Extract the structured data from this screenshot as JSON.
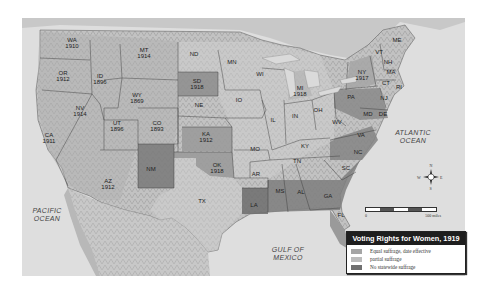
{
  "map": {
    "title": "Voting Rights for Women, 1919",
    "type": "choropleth",
    "region": "Continental United States",
    "colors": {
      "equal": "#a8a8a8",
      "partial": "#cfcfcf",
      "none": "#7a7a7a",
      "ocean": "#dedede",
      "land_terrain": "#bdbdbd"
    },
    "legend": [
      {
        "key": "equal",
        "label": "Equal suffrage, date effective",
        "color": "#a5a5a5"
      },
      {
        "key": "partial",
        "label": "partial suffrage",
        "color": "#bcbcbc"
      },
      {
        "key": "none",
        "label": "No statewide suffrage",
        "color": "#707070"
      }
    ],
    "scale": {
      "start": "0",
      "end": "500 miles"
    },
    "compass": {
      "n": "N",
      "s": "S",
      "e": "E",
      "w": "W"
    },
    "oceans": [
      {
        "name": "PACIFIC\nOCEAN",
        "x": 47,
        "y": 215
      },
      {
        "name": "ATLANTIC\nOCEAN",
        "x": 413,
        "y": 137
      },
      {
        "name": "GULF OF\nMEXICO",
        "x": 288,
        "y": 254
      }
    ],
    "states": [
      {
        "abbr": "WA",
        "year": "1910",
        "x": 72,
        "y": 43,
        "status": "equal"
      },
      {
        "abbr": "OR",
        "year": "1912",
        "x": 63,
        "y": 76,
        "status": "equal"
      },
      {
        "abbr": "CA",
        "year": "1911",
        "x": 49,
        "y": 138,
        "status": "equal"
      },
      {
        "abbr": "ID",
        "year": "1896",
        "x": 100,
        "y": 79,
        "status": "equal"
      },
      {
        "abbr": "NV",
        "year": "1914",
        "x": 80,
        "y": 111,
        "status": "equal"
      },
      {
        "abbr": "MT",
        "year": "1914",
        "x": 144,
        "y": 53,
        "status": "equal"
      },
      {
        "abbr": "WY",
        "year": "1869",
        "x": 137,
        "y": 98,
        "status": "equal"
      },
      {
        "abbr": "UT",
        "year": "1896",
        "x": 117,
        "y": 126,
        "status": "equal"
      },
      {
        "abbr": "CO",
        "year": "1893",
        "x": 157,
        "y": 126,
        "status": "equal"
      },
      {
        "abbr": "AZ",
        "year": "1912",
        "x": 108,
        "y": 184,
        "status": "equal"
      },
      {
        "abbr": "NM",
        "year": "",
        "x": 151,
        "y": 169,
        "status": "none"
      },
      {
        "abbr": "ND",
        "year": "",
        "x": 194,
        "y": 54,
        "status": "partial"
      },
      {
        "abbr": "SD",
        "year": "1918",
        "x": 197,
        "y": 84,
        "status": "equal"
      },
      {
        "abbr": "NE",
        "year": "",
        "x": 199,
        "y": 105,
        "status": "partial"
      },
      {
        "abbr": "KA",
        "year": "1912",
        "x": 206,
        "y": 137,
        "status": "equal"
      },
      {
        "abbr": "OK",
        "year": "1918",
        "x": 217,
        "y": 168,
        "status": "equal"
      },
      {
        "abbr": "TX",
        "year": "",
        "x": 202,
        "y": 201,
        "status": "partial"
      },
      {
        "abbr": "MN",
        "year": "",
        "x": 232,
        "y": 62,
        "status": "partial"
      },
      {
        "abbr": "IO",
        "year": "",
        "x": 239,
        "y": 100,
        "status": "partial"
      },
      {
        "abbr": "MO",
        "year": "",
        "x": 255,
        "y": 149,
        "status": "partial"
      },
      {
        "abbr": "AR",
        "year": "",
        "x": 256,
        "y": 174,
        "status": "partial"
      },
      {
        "abbr": "LA",
        "year": "",
        "x": 254,
        "y": 205,
        "status": "none"
      },
      {
        "abbr": "WI",
        "year": "",
        "x": 260,
        "y": 74,
        "status": "partial"
      },
      {
        "abbr": "IL",
        "year": "",
        "x": 273,
        "y": 120,
        "status": "partial"
      },
      {
        "abbr": "MI",
        "year": "1918",
        "x": 300,
        "y": 91,
        "status": "equal"
      },
      {
        "abbr": "IN",
        "year": "",
        "x": 295,
        "y": 116,
        "status": "partial"
      },
      {
        "abbr": "OH",
        "year": "",
        "x": 318,
        "y": 110,
        "status": "partial"
      },
      {
        "abbr": "KY",
        "year": "",
        "x": 305,
        "y": 146,
        "status": "partial"
      },
      {
        "abbr": "TN",
        "year": "",
        "x": 297,
        "y": 161,
        "status": "partial"
      },
      {
        "abbr": "MS",
        "year": "",
        "x": 280,
        "y": 191,
        "status": "none"
      },
      {
        "abbr": "AL",
        "year": "",
        "x": 301,
        "y": 192,
        "status": "none"
      },
      {
        "abbr": "GA",
        "year": "",
        "x": 328,
        "y": 196,
        "status": "none"
      },
      {
        "abbr": "FL",
        "year": "",
        "x": 341,
        "y": 215,
        "status": "none"
      },
      {
        "abbr": "SC",
        "year": "",
        "x": 346,
        "y": 168,
        "status": "none"
      },
      {
        "abbr": "NC",
        "year": "",
        "x": 358,
        "y": 152,
        "status": "none"
      },
      {
        "abbr": "VA",
        "year": "",
        "x": 361,
        "y": 135,
        "status": "none"
      },
      {
        "abbr": "WV",
        "year": "",
        "x": 337,
        "y": 122,
        "status": "partial"
      },
      {
        "abbr": "PA",
        "year": "",
        "x": 351,
        "y": 97,
        "status": "none"
      },
      {
        "abbr": "NY",
        "year": "1917",
        "x": 362,
        "y": 75,
        "status": "equal"
      },
      {
        "abbr": "NJ",
        "year": "",
        "x": 384,
        "y": 98,
        "status": "none"
      },
      {
        "abbr": "DE",
        "year": "",
        "x": 383,
        "y": 114,
        "status": "none"
      },
      {
        "abbr": "MD",
        "year": "",
        "x": 368,
        "y": 114,
        "status": "none"
      },
      {
        "abbr": "VT",
        "year": "",
        "x": 379,
        "y": 52,
        "status": "partial"
      },
      {
        "abbr": "NH",
        "year": "",
        "x": 388,
        "y": 62,
        "status": "partial"
      },
      {
        "abbr": "MA",
        "year": "",
        "x": 391,
        "y": 72,
        "status": "partial"
      },
      {
        "abbr": "CT",
        "year": "",
        "x": 386,
        "y": 83,
        "status": "partial"
      },
      {
        "abbr": "RI",
        "year": "",
        "x": 399,
        "y": 87,
        "status": "partial"
      },
      {
        "abbr": "ME",
        "year": "",
        "x": 397,
        "y": 40,
        "status": "partial"
      }
    ]
  }
}
